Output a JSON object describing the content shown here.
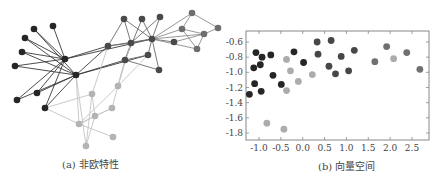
{
  "figure": {
    "panel_a": {
      "caption": "(a) 非欧特性",
      "colors": {
        "dark": "#262626",
        "mid": "#4a4a4a",
        "grey": "#6e6e6e",
        "light": "#b3b3b3"
      },
      "nodes": [
        {
          "id": "h1",
          "x": 65,
          "y": 59,
          "group": "dark"
        },
        {
          "id": "h2",
          "x": 76,
          "y": 75,
          "group": "dark"
        },
        {
          "id": "l1",
          "x": 34,
          "y": 29,
          "group": "dark"
        },
        {
          "id": "l2",
          "x": 53,
          "y": 26,
          "group": "dark"
        },
        {
          "id": "l3",
          "x": 25,
          "y": 38,
          "group": "dark"
        },
        {
          "id": "l4",
          "x": 22,
          "y": 52,
          "group": "dark"
        },
        {
          "id": "l5",
          "x": 15,
          "y": 66,
          "group": "dark"
        },
        {
          "id": "l6",
          "x": 37,
          "y": 93,
          "group": "dark"
        },
        {
          "id": "l7",
          "x": 17,
          "y": 100,
          "group": "dark"
        },
        {
          "id": "l8",
          "x": 45,
          "y": 108,
          "group": "dark"
        },
        {
          "id": "m1",
          "x": 108,
          "y": 46,
          "group": "mid"
        },
        {
          "id": "m2",
          "x": 125,
          "y": 60,
          "group": "mid"
        },
        {
          "id": "m3",
          "x": 131,
          "y": 43,
          "group": "mid"
        },
        {
          "id": "m4",
          "x": 152,
          "y": 39,
          "group": "mid"
        },
        {
          "id": "m5",
          "x": 160,
          "y": 17,
          "group": "mid"
        },
        {
          "id": "m6",
          "x": 124,
          "y": 19,
          "group": "mid"
        },
        {
          "id": "m7",
          "x": 142,
          "y": 19,
          "group": "mid"
        },
        {
          "id": "m8",
          "x": 148,
          "y": 55,
          "group": "mid"
        },
        {
          "id": "m9",
          "x": 159,
          "y": 70,
          "group": "mid"
        },
        {
          "id": "m10",
          "x": 174,
          "y": 42,
          "group": "mid"
        },
        {
          "id": "g1",
          "x": 192,
          "y": 13,
          "group": "grey"
        },
        {
          "id": "g2",
          "x": 182,
          "y": 29,
          "group": "grey"
        },
        {
          "id": "g3",
          "x": 204,
          "y": 34,
          "group": "grey"
        },
        {
          "id": "g4",
          "x": 197,
          "y": 49,
          "group": "grey"
        },
        {
          "id": "g5",
          "x": 218,
          "y": 28,
          "group": "grey"
        },
        {
          "id": "p1",
          "x": 118,
          "y": 86,
          "group": "light"
        },
        {
          "id": "p2",
          "x": 92,
          "y": 94,
          "group": "light"
        },
        {
          "id": "p3",
          "x": 95,
          "y": 116,
          "group": "light"
        },
        {
          "id": "p4",
          "x": 112,
          "y": 108,
          "group": "light"
        },
        {
          "id": "p5",
          "x": 79,
          "y": 124,
          "group": "light"
        },
        {
          "id": "p6",
          "x": 113,
          "y": 137,
          "group": "light"
        },
        {
          "id": "p7",
          "x": 86,
          "y": 146,
          "group": "light"
        }
      ],
      "edges": [
        [
          "h1",
          "l1",
          "dark"
        ],
        [
          "h1",
          "l2",
          "dark"
        ],
        [
          "h1",
          "l3",
          "dark"
        ],
        [
          "h1",
          "l4",
          "dark"
        ],
        [
          "h1",
          "l5",
          "dark"
        ],
        [
          "h1",
          "l6",
          "dark"
        ],
        [
          "h1",
          "l8",
          "dark"
        ],
        [
          "h1",
          "m1",
          "dark"
        ],
        [
          "h1",
          "m4",
          "dark"
        ],
        [
          "h2",
          "l1",
          "dark"
        ],
        [
          "h2",
          "l3",
          "dark"
        ],
        [
          "h2",
          "l4",
          "dark"
        ],
        [
          "h2",
          "l5",
          "dark"
        ],
        [
          "h2",
          "l6",
          "dark"
        ],
        [
          "h2",
          "l7",
          "dark"
        ],
        [
          "h2",
          "m1",
          "dark"
        ],
        [
          "h2",
          "m2",
          "dark"
        ],
        [
          "h2",
          "m8",
          "dark"
        ],
        [
          "l7",
          "h1",
          "dark"
        ],
        [
          "l8",
          "h2",
          "dark"
        ],
        [
          "m1",
          "m6",
          "mid"
        ],
        [
          "m1",
          "m3",
          "mid"
        ],
        [
          "m1",
          "m4",
          "mid"
        ],
        [
          "m2",
          "m3",
          "mid"
        ],
        [
          "m2",
          "m7",
          "mid"
        ],
        [
          "m2",
          "m8",
          "mid"
        ],
        [
          "m2",
          "m9",
          "mid"
        ],
        [
          "m3",
          "m5",
          "mid"
        ],
        [
          "m3",
          "m4",
          "mid"
        ],
        [
          "m3",
          "m6",
          "mid"
        ],
        [
          "m4",
          "m7",
          "mid"
        ],
        [
          "m4",
          "m5",
          "mid"
        ],
        [
          "m4",
          "m8",
          "mid"
        ],
        [
          "m4",
          "m9",
          "mid"
        ],
        [
          "m4",
          "m10",
          "mid"
        ],
        [
          "m6",
          "m4",
          "mid"
        ],
        [
          "m4",
          "g1",
          "grey"
        ],
        [
          "m4",
          "g2",
          "grey"
        ],
        [
          "m4",
          "g3",
          "grey"
        ],
        [
          "m4",
          "g4",
          "grey"
        ],
        [
          "g1",
          "g2",
          "grey"
        ],
        [
          "g1",
          "g5",
          "grey"
        ],
        [
          "g2",
          "g4",
          "grey"
        ],
        [
          "g2",
          "g3",
          "grey"
        ],
        [
          "g3",
          "g5",
          "grey"
        ],
        [
          "g3",
          "g4",
          "grey"
        ],
        [
          "m10",
          "g3",
          "grey"
        ],
        [
          "m1",
          "p2",
          "light"
        ],
        [
          "m2",
          "p1",
          "light"
        ],
        [
          "m3",
          "p1",
          "light"
        ],
        [
          "m8",
          "p1",
          "light"
        ],
        [
          "m2",
          "p4",
          "light"
        ],
        [
          "h2",
          "p5",
          "light"
        ],
        [
          "h2",
          "p7",
          "light"
        ],
        [
          "l8",
          "p2",
          "light"
        ],
        [
          "l8",
          "p5",
          "light"
        ],
        [
          "p1",
          "p5",
          "light"
        ],
        [
          "p2",
          "p3",
          "light"
        ],
        [
          "p3",
          "p4",
          "light"
        ],
        [
          "p3",
          "p5",
          "light"
        ],
        [
          "p3",
          "p7",
          "light"
        ],
        [
          "p5",
          "p6",
          "light"
        ],
        [
          "p4",
          "p5",
          "light"
        ],
        [
          "p2",
          "p7",
          "light"
        ]
      ]
    },
    "panel_b": {
      "caption": "(b) 向量空间"
    }
  },
  "chart_data": {
    "type": "scatter",
    "title": "(b) 向量空间",
    "xlabel": "",
    "ylabel": "",
    "xlim": [
      -1.3,
      2.9
    ],
    "ylim": [
      -1.9,
      -0.47
    ],
    "xticks": [
      -1.0,
      -0.5,
      0.0,
      0.5,
      1.0,
      1.5,
      2.0,
      2.5
    ],
    "xtick_labels": [
      "-1.0",
      "-0.5",
      "0.0",
      "0.5",
      "1.0",
      "1.5",
      "2.0",
      "2.5"
    ],
    "yticks": [
      -0.6,
      -0.8,
      -1.0,
      -1.2,
      -1.4,
      -1.6,
      -1.8
    ],
    "ytick_labels": [
      "-0.6",
      "-0.8",
      "-1.0",
      "-1.2",
      "-1.4",
      "-1.6",
      "-1.8"
    ],
    "grid": false,
    "series": [
      {
        "name": "dark",
        "color": "#262626",
        "points": [
          [
            -1.22,
            -1.29
          ],
          [
            -1.12,
            -0.94
          ],
          [
            -1.07,
            -0.74
          ],
          [
            -1.1,
            -1.15
          ],
          [
            -0.97,
            -0.9
          ],
          [
            -0.93,
            -0.8
          ],
          [
            -0.95,
            -1.25
          ],
          [
            -0.73,
            -0.77
          ],
          [
            -0.68,
            -1.04
          ],
          [
            -0.49,
            -1.16
          ],
          [
            -0.2,
            -0.73
          ],
          [
            0.02,
            -0.87
          ]
        ]
      },
      {
        "name": "mid",
        "color": "#474747",
        "points": [
          [
            0.33,
            -0.6
          ],
          [
            0.35,
            -0.76
          ],
          [
            0.6,
            -0.92
          ],
          [
            0.65,
            -0.58
          ],
          [
            0.75,
            -1.02
          ],
          [
            0.88,
            -0.79
          ],
          [
            1.05,
            -0.98
          ],
          [
            1.18,
            -0.71
          ]
        ]
      },
      {
        "name": "grey",
        "color": "#707070",
        "points": [
          [
            1.65,
            -0.86
          ],
          [
            1.92,
            -0.66
          ],
          [
            2.38,
            -0.74
          ],
          [
            2.68,
            -0.96
          ]
        ]
      },
      {
        "name": "light",
        "color": "#acacac",
        "points": [
          [
            -0.37,
            -0.83
          ],
          [
            -0.28,
            -0.98
          ],
          [
            -0.1,
            -1.12
          ],
          [
            0.22,
            -1.03
          ],
          [
            -0.37,
            -1.24
          ],
          [
            -0.82,
            -1.67
          ],
          [
            -0.43,
            -1.75
          ],
          [
            2.08,
            -0.82
          ]
        ]
      }
    ]
  }
}
